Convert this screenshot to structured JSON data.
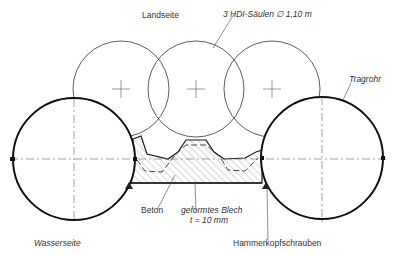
{
  "diagram": {
    "type": "technical cross-section drawing",
    "labels": {
      "landseite": "Landseite",
      "columns": "3 HDI-Säulen ∅ 1,10 m",
      "tragrohr": "Tragrohr",
      "beton": "Beton",
      "blech_line1": "geformtes Blech",
      "blech_line2": "t = 10 mm",
      "hammerkopf": "Hammerkopfschrauben",
      "wasserseite": "Wasserseite"
    },
    "components": {
      "hdi_columns": {
        "count": 3,
        "diameter": "1,10 m"
      },
      "support_pipes": {
        "count": 2,
        "label": "Tragrohr"
      },
      "concrete_fill": "Beton",
      "formed_sheet": {
        "name": "geformtes Blech",
        "thickness": "t = 10 mm"
      },
      "fasteners": "Hammerkopfschrauben"
    },
    "colors": {
      "line": "#1a1a1a",
      "thin_line": "#333333",
      "hatch": "#555555"
    }
  }
}
